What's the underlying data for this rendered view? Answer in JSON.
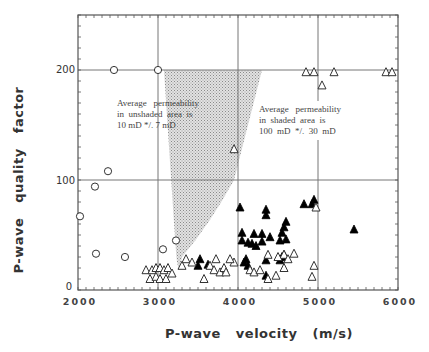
{
  "chart_data": {
    "type": "scatter",
    "title": "",
    "xlabel": "P-wave   velocity   (m/s)",
    "ylabel": "P-wave   quality   factor",
    "xlim": [
      2000,
      6000
    ],
    "ylim": [
      0,
      250
    ],
    "x_ticks": [
      "2000",
      "3000",
      "4000",
      "5000",
      "6000"
    ],
    "y_ticks": [
      "0",
      "100",
      "200"
    ],
    "grid": true,
    "grid_lines": {
      "x": [
        3000,
        4000,
        5000
      ],
      "y": [
        100,
        200
      ]
    },
    "annotations": [
      {
        "id": "unshaded",
        "lines": [
          "Average   permeability",
          "in  unshaded  area  is",
          "10 mD */. 7 mD"
        ]
      },
      {
        "id": "shaded",
        "lines": [
          "Average   permeability",
          "in  shaded  area  is",
          "100  mD  */.  30  mD"
        ]
      }
    ],
    "shaded_region": {
      "description": "stippled gray band containing high-permeability samples",
      "polygon": [
        [
          3075,
          200
        ],
        [
          4300,
          200
        ],
        [
          3950,
          100
        ],
        [
          3650,
          60
        ],
        [
          3300,
          30
        ],
        [
          3250,
          15
        ],
        [
          3250,
          35
        ],
        [
          3275,
          60
        ]
      ]
    },
    "series": [
      {
        "name": "open circles",
        "marker": "circle-open",
        "points": [
          [
            2450,
            200
          ],
          [
            3000,
            200
          ],
          [
            2375,
            108
          ],
          [
            2212,
            94
          ],
          [
            2025,
            67
          ],
          [
            2225,
            33
          ],
          [
            2587,
            30
          ],
          [
            3062,
            37
          ],
          [
            3225,
            45
          ]
        ]
      },
      {
        "name": "filled triangles",
        "marker": "triangle-filled",
        "points": [
          [
            3525,
            28
          ],
          [
            3500,
            22
          ],
          [
            3625,
            23
          ],
          [
            4025,
            75
          ],
          [
            4350,
            73
          ],
          [
            4350,
            68
          ],
          [
            4825,
            78
          ],
          [
            4950,
            82
          ],
          [
            4925,
            78
          ],
          [
            4600,
            62
          ],
          [
            4575,
            57
          ],
          [
            4550,
            52
          ],
          [
            4525,
            45
          ],
          [
            4050,
            52
          ],
          [
            4200,
            51
          ],
          [
            4300,
            51
          ],
          [
            4400,
            48
          ],
          [
            4600,
            46
          ],
          [
            4050,
            45
          ],
          [
            4125,
            43
          ],
          [
            4175,
            42
          ],
          [
            4225,
            40
          ],
          [
            4300,
            44
          ],
          [
            4100,
            28
          ],
          [
            4075,
            25
          ],
          [
            4125,
            22
          ],
          [
            4350,
            27
          ],
          [
            4550,
            30
          ],
          [
            4575,
            32
          ],
          [
            4525,
            27
          ],
          [
            4350,
            13
          ],
          [
            5450,
            55
          ]
        ]
      },
      {
        "name": "open triangles",
        "marker": "triangle-open",
        "points": [
          [
            3950,
            128
          ],
          [
            4850,
            198
          ],
          [
            4950,
            198
          ],
          [
            5200,
            198
          ],
          [
            5850,
            198
          ],
          [
            5925,
            198
          ],
          [
            5050,
            186
          ],
          [
            4975,
            75
          ],
          [
            2850,
            18
          ],
          [
            2925,
            18
          ],
          [
            2975,
            20
          ],
          [
            3025,
            20
          ],
          [
            3075,
            18
          ],
          [
            3125,
            20
          ],
          [
            3175,
            15
          ],
          [
            2900,
            10
          ],
          [
            2975,
            12
          ],
          [
            3025,
            10
          ],
          [
            3100,
            10
          ],
          [
            3300,
            22
          ],
          [
            3350,
            28
          ],
          [
            3425,
            25
          ],
          [
            3650,
            22
          ],
          [
            3700,
            18
          ],
          [
            3775,
            16
          ],
          [
            3825,
            20
          ],
          [
            3850,
            16
          ],
          [
            3575,
            10
          ],
          [
            3725,
            28
          ],
          [
            3950,
            25
          ],
          [
            3900,
            28
          ],
          [
            4375,
            32
          ],
          [
            4575,
            32
          ],
          [
            4500,
            30
          ],
          [
            4625,
            28
          ],
          [
            4700,
            33
          ],
          [
            4150,
            18
          ],
          [
            4200,
            16
          ],
          [
            4275,
            18
          ],
          [
            4375,
            10
          ],
          [
            4475,
            13
          ],
          [
            4575,
            20
          ],
          [
            4925,
            12
          ],
          [
            4950,
            22
          ]
        ]
      }
    ]
  }
}
